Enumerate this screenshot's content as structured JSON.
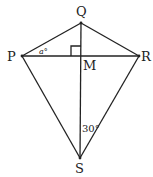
{
  "diagram": {
    "type": "kite",
    "points": {
      "Q": {
        "label": "Q",
        "x": 81,
        "y": 23
      },
      "P": {
        "label": "P",
        "x": 22,
        "y": 56
      },
      "R": {
        "label": "R",
        "x": 139,
        "y": 56
      },
      "M": {
        "label": "M",
        "x": 81,
        "y": 56
      },
      "S": {
        "label": "S",
        "x": 80,
        "y": 158
      }
    },
    "angle_labels": {
      "a": "a°",
      "s": "30°"
    },
    "right_angle_at": "M",
    "colors": {
      "line": "#222222",
      "background": "#ffffff"
    }
  }
}
